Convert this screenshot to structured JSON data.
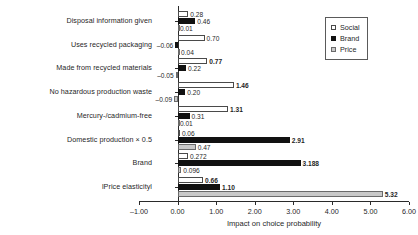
{
  "chart_data": {
    "type": "bar",
    "orientation": "horizontal",
    "title": "",
    "xlabel": "Impact on choice probability",
    "ylabel": "",
    "xlim": [
      -1.0,
      6.0
    ],
    "xticks": [
      "-1.00",
      "0.00",
      "1.00",
      "2.00",
      "3.00",
      "4.00",
      "5.00",
      "6.00"
    ],
    "xtick_values": [
      -1.0,
      0.0,
      1.0,
      2.0,
      3.0,
      4.0,
      5.0,
      6.0
    ],
    "grid": false,
    "legend_position": "top-right",
    "categories": [
      "Disposal information given",
      "Uses recycled packaging",
      "Made from recycled materials",
      "No hazardous production waste",
      "Mercury-/cadmium-free",
      "Domestic production × 0.5",
      "Brand",
      "lPrice elasticityl"
    ],
    "series": [
      {
        "name": "Social",
        "color": "#ffffff",
        "values": [
          0.28,
          0.7,
          0.77,
          1.46,
          1.31,
          0.06,
          0.272,
          0.66
        ],
        "labels": [
          "0.28",
          "0.70",
          "0.77",
          "1.46",
          "1.31",
          "0.06",
          "0.272",
          "0.66"
        ],
        "bold_labels": [
          false,
          false,
          true,
          true,
          true,
          false,
          false,
          true
        ]
      },
      {
        "name": "Brand",
        "color": "#111111",
        "values": [
          0.46,
          -0.06,
          0.22,
          0.2,
          0.31,
          2.91,
          3.188,
          1.1
        ],
        "labels": [
          "0.46",
          "-0.06",
          "0.22",
          "0.20",
          "0.31",
          "2.91",
          "3.188",
          "1.10"
        ],
        "bold_labels": [
          false,
          false,
          false,
          false,
          false,
          true,
          true,
          true
        ]
      },
      {
        "name": "Price",
        "color": "#c9c9c9",
        "values": [
          0.01,
          0.04,
          -0.05,
          -0.09,
          0.01,
          0.47,
          0.096,
          5.32
        ],
        "labels": [
          "0.01",
          "0.04",
          "-0.05",
          "-0.09",
          "0.01",
          "0.47",
          "0.096",
          "5.32"
        ],
        "bold_labels": [
          false,
          false,
          false,
          false,
          false,
          false,
          false,
          true
        ]
      }
    ]
  },
  "legend": {
    "items": [
      {
        "label": "Social",
        "swatch": "social"
      },
      {
        "label": "Brand",
        "swatch": "brand"
      },
      {
        "label": "Price",
        "swatch": "price"
      }
    ]
  },
  "axis": {
    "xlabel": "Impact on choice probability"
  }
}
